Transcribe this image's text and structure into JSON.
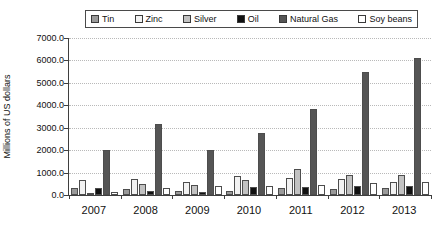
{
  "chart_data": {
    "type": "bar",
    "title": "",
    "xlabel": "",
    "ylabel": "Millions of US dollars",
    "categories": [
      "2007",
      "2008",
      "2009",
      "2010",
      "2011",
      "2012",
      "2013"
    ],
    "ylim": [
      0,
      7000
    ],
    "ytick_labels": [
      "7000.0",
      "6000.0",
      "5000.0",
      "4000.0",
      "3000.0",
      "2000.0",
      "1000.0",
      "0.0"
    ],
    "ytick_values": [
      7000,
      6000,
      5000,
      4000,
      3000,
      2000,
      1000,
      0
    ],
    "ytick_step": 1000,
    "grid": true,
    "legend_position": "top",
    "series": [
      {
        "name": "Tin",
        "color": "#9a9a9a",
        "values": [
          300,
          250,
          180,
          200,
          330,
          250,
          320
        ]
      },
      {
        "name": "Zinc",
        "color": "#f2f2f2",
        "values": [
          650,
          700,
          560,
          870,
          760,
          700,
          560
        ]
      },
      {
        "name": "Silver",
        "color": "#c2c2c2",
        "values": [
          110,
          500,
          430,
          690,
          1150,
          900,
          900
        ]
      },
      {
        "name": "Oil",
        "color": "#111111",
        "values": [
          300,
          200,
          120,
          350,
          360,
          380,
          400
        ]
      },
      {
        "name": "Natural Gas",
        "color": "#555555",
        "values": [
          2000,
          3150,
          2000,
          2750,
          3850,
          5500,
          6100
        ]
      },
      {
        "name": "Soy beans",
        "color": "#ffffff",
        "values": [
          150,
          300,
          380,
          400,
          450,
          520,
          560
        ]
      }
    ]
  }
}
